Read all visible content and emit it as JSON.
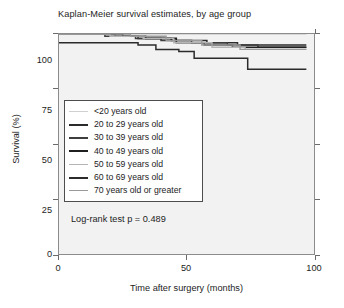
{
  "chart_data": {
    "type": "line",
    "subtype": "kaplan-meier-step",
    "title": "Kaplan-Meier survival estimates, by age group",
    "xlabel": "Time after surgery (months)",
    "ylabel": "Survival (%)",
    "xlim": [
      0,
      100
    ],
    "ylim": [
      0,
      100
    ],
    "xticks": [
      0,
      50,
      100
    ],
    "xtick_labels": [
      "0",
      "50",
      "100"
    ],
    "yticks": [
      0,
      25,
      50,
      75,
      100
    ],
    "ytick_labels": [
      "0",
      "25",
      "50",
      "75",
      "100"
    ],
    "grid": false,
    "legend_position": "center-left-inside",
    "annotation": "Log-rank test p = 0.489",
    "series": [
      {
        "name": "<20 years old",
        "label": "<20 years old",
        "color": "#cfcfcf",
        "width": 1.4,
        "x": [
          0,
          97
        ],
        "y": [
          100,
          100
        ]
      },
      {
        "name": "20 to 29 years old",
        "label": "20 to 29 years old",
        "color": "#2b2b2b",
        "width": 1.5,
        "x": [
          0,
          22,
          22,
          31,
          31,
          44,
          44,
          58,
          58,
          70,
          70,
          97
        ],
        "y": [
          100,
          100,
          99,
          99,
          98,
          98,
          97,
          97,
          96,
          96,
          95,
          95
        ]
      },
      {
        "name": "30 to 39 years old",
        "label": "30 to 39 years old",
        "color": "#3d3d3d",
        "width": 1.5,
        "x": [
          0,
          18,
          18,
          30,
          30,
          40,
          40,
          52,
          52,
          66,
          66,
          78,
          78,
          97
        ],
        "y": [
          100,
          100,
          99,
          99,
          98,
          98,
          97,
          97,
          96,
          96,
          95,
          95,
          94,
          94
        ]
      },
      {
        "name": "40 to 49 years old",
        "label": "40 to 49 years old",
        "color": "#1f1f1f",
        "width": 1.6,
        "x": [
          0,
          25,
          25,
          34,
          34,
          46,
          46,
          57,
          57,
          68,
          68,
          97
        ],
        "y": [
          100,
          100,
          99,
          99,
          98,
          98,
          96,
          96,
          95,
          95,
          94,
          94
        ]
      },
      {
        "name": "50 to 59 years old",
        "label": "50 to 59 years old",
        "color": "#b5b5b5",
        "width": 1.4,
        "x": [
          0,
          20,
          20,
          33,
          33,
          45,
          45,
          60,
          60,
          73,
          73,
          97
        ],
        "y": [
          100,
          100,
          99,
          99,
          98,
          98,
          96,
          96,
          94,
          94,
          93,
          93
        ]
      },
      {
        "name": "60 to 69 years old",
        "label": "60 to 69 years old",
        "color": "#2b2b2b",
        "width": 1.5,
        "x": [
          0,
          31,
          31,
          38,
          38,
          47,
          47,
          53,
          53,
          74,
          74,
          97
        ],
        "y": [
          96,
          96,
          95,
          95,
          93,
          93,
          92,
          92,
          89,
          89,
          84,
          84
        ]
      },
      {
        "name": "70 years old or greater",
        "label": "70 years old or greater",
        "color": "#9a9a9a",
        "width": 1.4,
        "x": [
          0,
          28,
          28,
          42,
          42,
          56,
          56,
          71,
          71,
          97
        ],
        "y": [
          100,
          100,
          99,
          99,
          97,
          97,
          95,
          95,
          93,
          93
        ]
      }
    ]
  },
  "legend": {
    "entries": [
      {
        "label": "<20 years old"
      },
      {
        "label": "20 to 29 years old"
      },
      {
        "label": "30 to 39 years old"
      },
      {
        "label": "40 to 49 years old"
      },
      {
        "label": "50 to 59 years old"
      },
      {
        "label": "60 to 69 years old"
      },
      {
        "label": "70 years old or greater"
      }
    ]
  },
  "colors": {
    "plot_background": "#f2f2f2",
    "page_background": "#ffffff",
    "frame": "#8c8c8c",
    "text": "#1d1d1d",
    "legend_border": "#4d4d4d"
  }
}
